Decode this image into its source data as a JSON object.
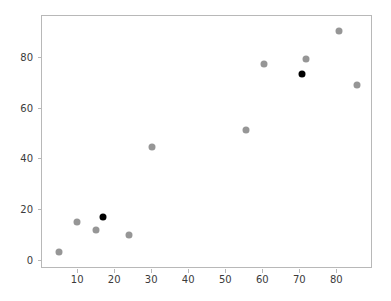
{
  "chart_data": {
    "type": "scatter",
    "title": "",
    "xlabel": "",
    "ylabel": "",
    "xlim": [
      0.5,
      89.9
    ],
    "ylim": [
      -3.5,
      96.0
    ],
    "grid": false,
    "legend": null,
    "xticks": [
      10,
      20,
      30,
      40,
      50,
      60,
      70,
      80
    ],
    "yticks": [
      0,
      20,
      40,
      60,
      80
    ],
    "xtick_labels": [
      "10",
      "20",
      "30",
      "40",
      "50",
      "60",
      "70",
      "80"
    ],
    "ytick_labels": [
      "0",
      "20",
      "40",
      "60",
      "80"
    ],
    "colors": {
      "highlight": "#000000",
      "normal": "#969696",
      "axis": "#b8b8b8",
      "text": "#3b3b3b",
      "background": "#ffffff"
    },
    "series": [
      {
        "name": "normal",
        "color": "#969696",
        "points": [
          {
            "x": 5.0,
            "y": 3.0
          },
          {
            "x": 10.0,
            "y": 15.0
          },
          {
            "x": 15.0,
            "y": 12.0
          },
          {
            "x": 24.0,
            "y": 10.0
          },
          {
            "x": 30.2,
            "y": 44.5
          },
          {
            "x": 55.5,
            "y": 51.0
          },
          {
            "x": 60.5,
            "y": 77.0
          },
          {
            "x": 71.8,
            "y": 79.0
          },
          {
            "x": 80.8,
            "y": 90.0
          },
          {
            "x": 85.5,
            "y": 68.8
          }
        ]
      },
      {
        "name": "highlight",
        "color": "#000000",
        "points": [
          {
            "x": 17.0,
            "y": 16.8
          },
          {
            "x": 70.6,
            "y": 73.2
          }
        ]
      }
    ]
  }
}
